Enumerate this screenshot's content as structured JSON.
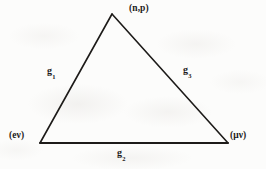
{
  "figure": {
    "background_color": "#fcfcfb",
    "line_color": "#1d1b19",
    "text_color": "#1d1b19"
  },
  "vertices": [
    {
      "id": "np",
      "label": "(n,p)",
      "name": "nucleon-pair",
      "x": 112,
      "y": 14
    },
    {
      "id": "enu",
      "label": "(eν)",
      "name": "electron-neutrino-pair",
      "x": 40,
      "y": 143
    },
    {
      "id": "munu",
      "label": "(μν)",
      "name": "muon-neutrino-pair",
      "x": 228,
      "y": 143
    }
  ],
  "edges": [
    {
      "id": "g1",
      "label_base": "g",
      "label_sub": "1",
      "name": "coupling-constant-g1",
      "from": "enu",
      "to": "np"
    },
    {
      "id": "g2",
      "label_base": "g",
      "label_sub": "2",
      "name": "coupling-constant-g2",
      "from": "enu",
      "to": "munu"
    },
    {
      "id": "g3",
      "label_base": "g",
      "label_sub": "3",
      "name": "coupling-constant-g3",
      "from": "np",
      "to": "munu"
    }
  ]
}
